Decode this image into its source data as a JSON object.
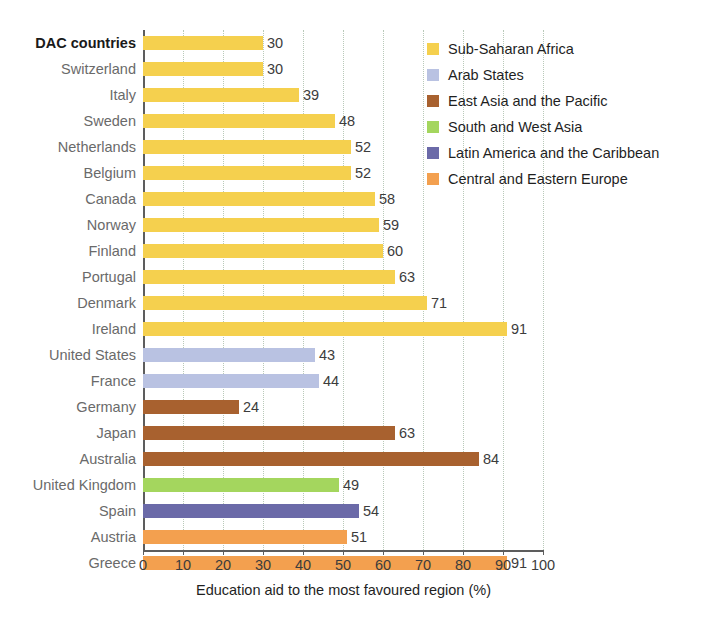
{
  "chart_data": {
    "type": "bar",
    "orientation": "horizontal",
    "title": "",
    "xlabel": "Education aid to the most favoured region (%)",
    "ylabel": "",
    "xlim": [
      0,
      100
    ],
    "xticks": [
      0,
      10,
      20,
      30,
      40,
      50,
      60,
      70,
      80,
      90,
      100
    ],
    "grid": true,
    "legend_position": "right",
    "categories": [
      "DAC countries",
      "Switzerland",
      "Italy",
      "Sweden",
      "Netherlands",
      "Belgium",
      "Canada",
      "Norway",
      "Finland",
      "Portugal",
      "Denmark",
      "Ireland",
      "United States",
      "France",
      "Germany",
      "Japan",
      "Australia",
      "United Kingdom",
      "Spain",
      "Austria",
      "Greece"
    ],
    "values": [
      30,
      30,
      39,
      48,
      52,
      52,
      58,
      59,
      60,
      63,
      71,
      91,
      43,
      44,
      24,
      63,
      84,
      49,
      54,
      51,
      91
    ],
    "point_groups": [
      "Sub-Saharan Africa",
      "Sub-Saharan Africa",
      "Sub-Saharan Africa",
      "Sub-Saharan Africa",
      "Sub-Saharan Africa",
      "Sub-Saharan Africa",
      "Sub-Saharan Africa",
      "Sub-Saharan Africa",
      "Sub-Saharan Africa",
      "Sub-Saharan Africa",
      "Sub-Saharan Africa",
      "Sub-Saharan Africa",
      "Arab States",
      "Arab States",
      "East Asia and the Pacific",
      "East Asia and the Pacific",
      "East Asia and the Pacific",
      "South and West Asia",
      "Latin America and the Caribbean",
      "Central and Eastern Europe",
      "Central and Eastern Europe"
    ],
    "series": [
      {
        "name": "Sub-Saharan Africa",
        "color": "#f5d04e",
        "points": [
          {
            "category": "DAC countries",
            "value": 30
          },
          {
            "category": "Switzerland",
            "value": 30
          },
          {
            "category": "Italy",
            "value": 39
          },
          {
            "category": "Sweden",
            "value": 48
          },
          {
            "category": "Netherlands",
            "value": 52
          },
          {
            "category": "Belgium",
            "value": 52
          },
          {
            "category": "Canada",
            "value": 58
          },
          {
            "category": "Norway",
            "value": 59
          },
          {
            "category": "Finland",
            "value": 60
          },
          {
            "category": "Portugal",
            "value": 63
          },
          {
            "category": "Denmark",
            "value": 71
          },
          {
            "category": "Ireland",
            "value": 91
          }
        ]
      },
      {
        "name": "Arab States",
        "color": "#b9c2e2",
        "points": [
          {
            "category": "United States",
            "value": 43
          },
          {
            "category": "France",
            "value": 44
          }
        ]
      },
      {
        "name": "East Asia and the Pacific",
        "color": "#a8612f",
        "points": [
          {
            "category": "Germany",
            "value": 24
          },
          {
            "category": "Japan",
            "value": 63
          },
          {
            "category": "Australia",
            "value": 84
          }
        ]
      },
      {
        "name": "South and West Asia",
        "color": "#a4d65e",
        "points": [
          {
            "category": "United Kingdom",
            "value": 49
          }
        ]
      },
      {
        "name": "Latin America and the Caribbean",
        "color": "#6b6aa8",
        "points": [
          {
            "category": "Spain",
            "value": 54
          }
        ]
      },
      {
        "name": "Central and Eastern Europe",
        "color": "#f3a04f",
        "points": [
          {
            "category": "Austria",
            "value": 51
          },
          {
            "category": "Greece",
            "value": 91
          }
        ]
      }
    ]
  },
  "axis": {
    "xtick_labels": [
      "0",
      "10",
      "20",
      "30",
      "40",
      "50",
      "60",
      "70",
      "80",
      "90",
      "100"
    ],
    "title": "Education aid to the most favoured region (%)"
  },
  "rows": [
    {
      "label": "DAC countries",
      "value": 30,
      "value_label": "30",
      "color": "#f5d04e",
      "emphasis": true
    },
    {
      "label": "Switzerland",
      "value": 30,
      "value_label": "30",
      "color": "#f5d04e",
      "emphasis": false
    },
    {
      "label": "Italy",
      "value": 39,
      "value_label": "39",
      "color": "#f5d04e",
      "emphasis": false
    },
    {
      "label": "Sweden",
      "value": 48,
      "value_label": "48",
      "color": "#f5d04e",
      "emphasis": false
    },
    {
      "label": "Netherlands",
      "value": 52,
      "value_label": "52",
      "color": "#f5d04e",
      "emphasis": false
    },
    {
      "label": "Belgium",
      "value": 52,
      "value_label": "52",
      "color": "#f5d04e",
      "emphasis": false
    },
    {
      "label": "Canada",
      "value": 58,
      "value_label": "58",
      "color": "#f5d04e",
      "emphasis": false
    },
    {
      "label": "Norway",
      "value": 59,
      "value_label": "59",
      "color": "#f5d04e",
      "emphasis": false
    },
    {
      "label": "Finland",
      "value": 60,
      "value_label": "60",
      "color": "#f5d04e",
      "emphasis": false
    },
    {
      "label": "Portugal",
      "value": 63,
      "value_label": "63",
      "color": "#f5d04e",
      "emphasis": false
    },
    {
      "label": "Denmark",
      "value": 71,
      "value_label": "71",
      "color": "#f5d04e",
      "emphasis": false
    },
    {
      "label": "Ireland",
      "value": 91,
      "value_label": "91",
      "color": "#f5d04e",
      "emphasis": false
    },
    {
      "label": "United States",
      "value": 43,
      "value_label": "43",
      "color": "#b9c2e2",
      "emphasis": false
    },
    {
      "label": "France",
      "value": 44,
      "value_label": "44",
      "color": "#b9c2e2",
      "emphasis": false
    },
    {
      "label": "Germany",
      "value": 24,
      "value_label": "24",
      "color": "#a8612f",
      "emphasis": false
    },
    {
      "label": "Japan",
      "value": 63,
      "value_label": "63",
      "color": "#a8612f",
      "emphasis": false
    },
    {
      "label": "Australia",
      "value": 84,
      "value_label": "84",
      "color": "#a8612f",
      "emphasis": false
    },
    {
      "label": "United Kingdom",
      "value": 49,
      "value_label": "49",
      "color": "#a4d65e",
      "emphasis": false
    },
    {
      "label": "Spain",
      "value": 54,
      "value_label": "54",
      "color": "#6b6aa8",
      "emphasis": false
    },
    {
      "label": "Austria",
      "value": 51,
      "value_label": "51",
      "color": "#f3a04f",
      "emphasis": false
    },
    {
      "label": "Greece",
      "value": 91,
      "value_label": "91",
      "color": "#f3a04f",
      "emphasis": false
    }
  ],
  "legend": {
    "items": [
      {
        "label": "Sub-Saharan Africa",
        "color": "#f5d04e"
      },
      {
        "label": "Arab States",
        "color": "#b9c2e2"
      },
      {
        "label": "East Asia and the Pacific",
        "color": "#a8612f"
      },
      {
        "label": "South and West Asia",
        "color": "#a4d65e"
      },
      {
        "label": "Latin America and the Caribbean",
        "color": "#6b6aa8"
      },
      {
        "label": "Central and Eastern Europe",
        "color": "#f3a04f"
      }
    ]
  }
}
